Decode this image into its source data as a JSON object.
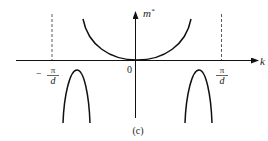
{
  "figure": {
    "caption": "(c)",
    "y_axis_label": "m",
    "y_axis_superscript": "*",
    "x_axis_label": "k",
    "origin_label": "0",
    "left_bound": {
      "sign": "−",
      "numerator": "π",
      "denominator": "d"
    },
    "right_bound": {
      "numerator": "π",
      "denominator": "d"
    },
    "colors": {
      "stroke": "#111111",
      "background": "#ffffff"
    }
  }
}
